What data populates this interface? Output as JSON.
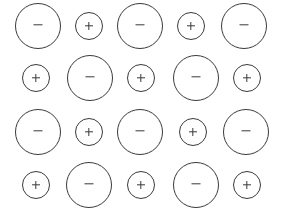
{
  "canvas": {
    "width": 282,
    "height": 219,
    "background_color": "#ffffff",
    "stroke_color": "#3a3a3a",
    "stroke_width": 1.4
  },
  "legend": {
    "negative_symbol": "−",
    "positive_symbol": "+",
    "large_radius": 23,
    "small_radius": 14
  },
  "grid": {
    "rows": 4,
    "columns": 5,
    "row_centers_y": [
      26,
      78,
      132,
      185
    ],
    "column_centers_x_odd_rows": [
      38,
      89,
      140,
      191,
      244
    ],
    "column_centers_x_even_rows": [
      36,
      90,
      141,
      196,
      247
    ]
  },
  "circles": [
    {
      "id": "r1c1",
      "row": 1,
      "col": 1,
      "cx": 38,
      "cy": 26,
      "r": 23,
      "size": "large",
      "charge": "negative",
      "symbol": "−"
    },
    {
      "id": "r1c2",
      "row": 1,
      "col": 2,
      "cx": 89,
      "cy": 26,
      "r": 14,
      "size": "small",
      "charge": "positive",
      "symbol": "+"
    },
    {
      "id": "r1c3",
      "row": 1,
      "col": 3,
      "cx": 140,
      "cy": 26,
      "r": 23,
      "size": "large",
      "charge": "negative",
      "symbol": "−"
    },
    {
      "id": "r1c4",
      "row": 1,
      "col": 4,
      "cx": 191,
      "cy": 26,
      "r": 14,
      "size": "small",
      "charge": "positive",
      "symbol": "+"
    },
    {
      "id": "r1c5",
      "row": 1,
      "col": 5,
      "cx": 244,
      "cy": 26,
      "r": 23,
      "size": "large",
      "charge": "negative",
      "symbol": "−"
    },
    {
      "id": "r2c1",
      "row": 2,
      "col": 1,
      "cx": 36,
      "cy": 78,
      "r": 14,
      "size": "small",
      "charge": "positive",
      "symbol": "+"
    },
    {
      "id": "r2c2",
      "row": 2,
      "col": 2,
      "cx": 90,
      "cy": 78,
      "r": 23,
      "size": "large",
      "charge": "negative",
      "symbol": "−"
    },
    {
      "id": "r2c3",
      "row": 2,
      "col": 3,
      "cx": 141,
      "cy": 78,
      "r": 14,
      "size": "small",
      "charge": "positive",
      "symbol": "+"
    },
    {
      "id": "r2c4",
      "row": 2,
      "col": 4,
      "cx": 196,
      "cy": 78,
      "r": 23,
      "size": "large",
      "charge": "negative",
      "symbol": "−"
    },
    {
      "id": "r2c5",
      "row": 2,
      "col": 5,
      "cx": 247,
      "cy": 78,
      "r": 14,
      "size": "small",
      "charge": "positive",
      "symbol": "+"
    },
    {
      "id": "r3c1",
      "row": 3,
      "col": 1,
      "cx": 38,
      "cy": 132,
      "r": 23,
      "size": "large",
      "charge": "negative",
      "symbol": "−"
    },
    {
      "id": "r3c2",
      "row": 3,
      "col": 2,
      "cx": 89,
      "cy": 132,
      "r": 14,
      "size": "small",
      "charge": "positive",
      "symbol": "+"
    },
    {
      "id": "r3c3",
      "row": 3,
      "col": 3,
      "cx": 140,
      "cy": 132,
      "r": 23,
      "size": "large",
      "charge": "negative",
      "symbol": "−"
    },
    {
      "id": "r3c4",
      "row": 3,
      "col": 4,
      "cx": 193,
      "cy": 132,
      "r": 14,
      "size": "small",
      "charge": "positive",
      "symbol": "+"
    },
    {
      "id": "r3c5",
      "row": 3,
      "col": 5,
      "cx": 246,
      "cy": 132,
      "r": 23,
      "size": "large",
      "charge": "negative",
      "symbol": "−"
    },
    {
      "id": "r4c1",
      "row": 4,
      "col": 1,
      "cx": 36,
      "cy": 185,
      "r": 14,
      "size": "small",
      "charge": "positive",
      "symbol": "+"
    },
    {
      "id": "r4c2",
      "row": 4,
      "col": 2,
      "cx": 89,
      "cy": 185,
      "r": 23,
      "size": "large",
      "charge": "negative",
      "symbol": "−"
    },
    {
      "id": "r4c3",
      "row": 4,
      "col": 3,
      "cx": 141,
      "cy": 185,
      "r": 14,
      "size": "small",
      "charge": "positive",
      "symbol": "+"
    },
    {
      "id": "r4c4",
      "row": 4,
      "col": 4,
      "cx": 196,
      "cy": 185,
      "r": 23,
      "size": "large",
      "charge": "negative",
      "symbol": "−"
    },
    {
      "id": "r4c5",
      "row": 4,
      "col": 5,
      "cx": 247,
      "cy": 185,
      "r": 14,
      "size": "small",
      "charge": "positive",
      "symbol": "+"
    }
  ]
}
